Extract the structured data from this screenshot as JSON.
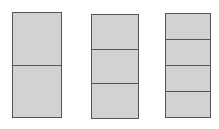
{
  "figure": {
    "title": "",
    "background_color": "#ffffff",
    "fill_color": "#d2d2d2",
    "border_color": "#555555"
  },
  "chart_data": {
    "type": "bar",
    "title": "",
    "xlabel": "",
    "ylabel": "",
    "grid": false,
    "legend": null,
    "categories": [
      "rectangle-1",
      "rectangle-2",
      "rectangle-3"
    ],
    "values": [
      2,
      3,
      4
    ],
    "series": [
      {
        "name": "number of equal parts",
        "values": [
          2,
          3,
          4
        ]
      }
    ],
    "bars": [
      {
        "name": "rectangle-1",
        "divisions": 2,
        "fraction_each": "1/2",
        "x": 12,
        "y": 12,
        "width": 50,
        "height": 106,
        "segments": [
          "1/2",
          "1/2"
        ]
      },
      {
        "name": "rectangle-2",
        "divisions": 3,
        "fraction_each": "1/3",
        "x": 91,
        "y": 14,
        "width": 48,
        "height": 105,
        "segments": [
          "1/3",
          "1/3",
          "1/3"
        ]
      },
      {
        "name": "rectangle-3",
        "divisions": 4,
        "fraction_each": "1/4",
        "x": 165,
        "y": 13,
        "width": 46,
        "height": 105,
        "segments": [
          "1/4",
          "1/4",
          "1/4",
          "1/4"
        ]
      }
    ]
  }
}
